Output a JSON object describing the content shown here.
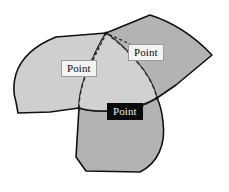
{
  "figure": {
    "type": "venn-three-petal-diagram",
    "background_color": "#ffffff",
    "stroke_color": "#111111",
    "title": ""
  },
  "regions": [
    {
      "id": "left-petal",
      "name": "left-region",
      "fill": "#cfcfcf",
      "label_ref": "labels.0"
    },
    {
      "id": "right-petal",
      "name": "right-region",
      "fill": "#b3b3b3",
      "label_ref": "labels.1"
    },
    {
      "id": "bottom-petal",
      "name": "bottom-region",
      "fill": "#b3b3b3",
      "label_ref": "labels.2"
    },
    {
      "id": "center-overlap",
      "name": "center-overlap-region",
      "fill": "#c9c9c9",
      "label_ref": null
    }
  ],
  "labels": [
    {
      "id": "label-left",
      "text": "Point",
      "style": "light",
      "background": "#f4f4f4",
      "text_color": "#0d0d0d",
      "border_color": "#9a9a9a"
    },
    {
      "id": "label-right",
      "text": "Point",
      "style": "light",
      "background": "#f4f4f4",
      "text_color": "#0d0d0d",
      "border_color": "#9a9a9a"
    },
    {
      "id": "label-bottom",
      "text": "Point",
      "style": "dark",
      "background": "#0b0b0b",
      "text_color": "#e9e9e9",
      "border_color": "#0b0b0b"
    }
  ],
  "leaders": [
    {
      "id": "leader-left",
      "from_label": "label-left",
      "to_vertex": "top-junction"
    },
    {
      "id": "leader-right",
      "from_label": "label-right",
      "to_vertex": "top-junction"
    },
    {
      "id": "leader-bottom",
      "from_label": "label-bottom",
      "to_vertex": "right-junction"
    }
  ],
  "vertices": [
    {
      "id": "top-junction",
      "x": 106,
      "y": 33
    },
    {
      "id": "right-junction",
      "x": 157,
      "y": 98
    },
    {
      "id": "bottom-junction",
      "x": 79,
      "y": 108
    }
  ]
}
